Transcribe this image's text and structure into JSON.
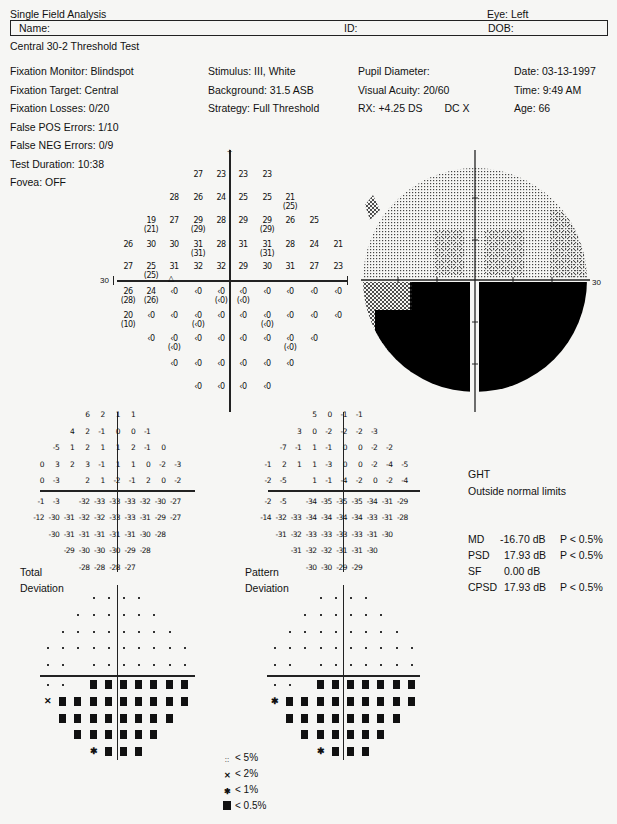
{
  "header": {
    "title": "Single Field Analysis",
    "eye": "Eye: Left",
    "name_label": "Name:",
    "id_label": "ID:",
    "dob_label": "DOB:",
    "test_name": "Central 30-2 Threshold Test"
  },
  "info": {
    "col1": [
      "Fixation Monitor: Blindspot",
      "Fixation Target: Central",
      "Fixation Losses: 0/20",
      "False POS Errors: 1/10",
      "False NEG Errors: 0/9",
      "Test Duration: 10:38"
    ],
    "col2": [
      "Stimulus: III, White",
      "Background: 31.5 ASB",
      "Strategy: Full Threshold"
    ],
    "col3": [
      "Pupil Diameter:",
      "Visual Acuity: 20/60",
      "RX: +4.25 DS",
      "DC  X"
    ],
    "col4": [
      "Date: 03-13-1997",
      "Time:  9:49 AM",
      "Age: 66"
    ],
    "fovea": "Fovea: OFF"
  },
  "threshold_axis_label": "30",
  "grayscale_axis_label": "30",
  "labels": {
    "total": "Total",
    "deviation": "Deviation",
    "pattern": "Pattern",
    "deviation2": "Deviation"
  },
  "ght": {
    "title": "GHT",
    "result": "Outside normal limits"
  },
  "indices": [
    {
      "name": "MD",
      "value": "-16.70 dB",
      "p": "P < 0.5%"
    },
    {
      "name": "PSD",
      "value": "17.93 dB",
      "p": "P < 0.5%"
    },
    {
      "name": "SF",
      "value": "0.00 dB",
      "p": ""
    },
    {
      "name": "CPSD",
      "value": "17.93 dB",
      "p": "P < 0.5%"
    }
  ],
  "legend": [
    {
      "symbol": "dots",
      "label": "< 5%"
    },
    {
      "symbol": "light-hatch",
      "label": "< 2%"
    },
    {
      "symbol": "dark-hatch",
      "label": "< 1%"
    },
    {
      "symbol": "solid",
      "label": "< 0.5%"
    }
  ],
  "chart_data": [
    {
      "type": "table",
      "title": "Threshold values (dB), Central 30-2, Left eye",
      "grid_columns_x_deg": [
        -27,
        -21,
        -15,
        -9,
        -3,
        3,
        9,
        15,
        21,
        27
      ],
      "rows": [
        {
          "y": 27,
          "cells": [
            null,
            null,
            null,
            "27",
            "23",
            "23",
            "23",
            null,
            null,
            null
          ]
        },
        {
          "y": 21,
          "cells": [
            null,
            null,
            "28",
            "26",
            "24",
            "25",
            "25",
            "21 (25)",
            null,
            null
          ]
        },
        {
          "y": 15,
          "cells": [
            null,
            "19 (21)",
            "27",
            "29 (29)",
            "28",
            "29",
            "29 (29)",
            "26",
            "25",
            null
          ]
        },
        {
          "y": 9,
          "cells": [
            "26",
            "30",
            "30",
            "31 (31)",
            "28",
            "31",
            "31 (31)",
            "28",
            "24",
            "21"
          ]
        },
        {
          "y": 3,
          "cells": [
            "27",
            "25 (25)",
            "31",
            "32",
            "32",
            "29",
            "30",
            "31",
            "27",
            "23"
          ]
        },
        {
          "y": -3,
          "cells": [
            "26 (28)",
            "24 (26)",
            "<0",
            "<0",
            "<0 (<0)",
            "<0 (<0)",
            "<0",
            "<0",
            "<0",
            "<0"
          ]
        },
        {
          "y": -9,
          "cells": [
            "20 (10)",
            "<0",
            "<0",
            "<0 (<0)",
            "<0",
            "<0",
            "<0 (<0)",
            "<0",
            "<0",
            "<0"
          ]
        },
        {
          "y": -15,
          "cells": [
            null,
            "<0",
            "<0 (<0)",
            "<0",
            "<0",
            "<0",
            "<0",
            "<0 (<0)",
            "<0",
            null
          ]
        },
        {
          "y": -21,
          "cells": [
            null,
            null,
            "<0",
            "<0",
            "<0",
            "<0",
            "<0",
            "<0",
            null,
            null
          ]
        },
        {
          "y": -27,
          "cells": [
            null,
            null,
            null,
            "<0",
            "<0",
            "<0",
            "<0",
            null,
            null,
            null
          ]
        }
      ],
      "blind_spot_marker": "triangle at (-15, -3)",
      "axis_extent_label": "30"
    },
    {
      "type": "heatmap",
      "title": "Grayscale",
      "description": "Upper hemifield light stipple; lower hemifield solid black except inferonasal-left edge patchy",
      "axis_extent_label": "30"
    },
    {
      "type": "table",
      "title": "Total Deviation (dB)",
      "rows": [
        [
          "",
          "",
          "",
          "6",
          "2",
          "1",
          "1",
          "",
          "",
          ""
        ],
        [
          "",
          "",
          "4",
          "2",
          "-1",
          "0",
          "0",
          "-1",
          "",
          ""
        ],
        [
          "",
          "-5",
          "1",
          "2",
          "1",
          "1",
          "2",
          "-1",
          "0",
          ""
        ],
        [
          "0",
          "3",
          "2",
          "3",
          "-1",
          "1",
          "1",
          "0",
          "-2",
          "-3"
        ],
        [
          "0",
          "-3",
          "",
          "2",
          "1",
          "-2",
          "-1",
          "2",
          "0",
          "-2"
        ],
        [
          "-1",
          "-3",
          "",
          "-32",
          "-33",
          "-33",
          "-33",
          "-32",
          "-30",
          "-27"
        ],
        [
          "-12",
          "-30",
          "-31",
          "-32",
          "-32",
          "-33",
          "-33",
          "-31",
          "-29",
          "-27"
        ],
        [
          "",
          "-30",
          "-31",
          "-31",
          "-31",
          "-31",
          "-31",
          "-30",
          "-28",
          ""
        ],
        [
          "",
          "",
          "-29",
          "-30",
          "-30",
          "-30",
          "-29",
          "-28",
          "",
          ""
        ],
        [
          "",
          "",
          "",
          "-28",
          "-28",
          "-28",
          "-27",
          "",
          "",
          ""
        ]
      ]
    },
    {
      "type": "table",
      "title": "Pattern Deviation (dB)",
      "rows": [
        [
          "",
          "",
          "",
          "5",
          "0",
          "-1",
          "-1",
          "",
          "",
          ""
        ],
        [
          "",
          "",
          "3",
          "0",
          "-2",
          "-2",
          "-2",
          "-3",
          "",
          ""
        ],
        [
          "",
          "-7",
          "-1",
          "1",
          "-1",
          "0",
          "0",
          "-2",
          "-2",
          ""
        ],
        [
          "-1",
          "2",
          "1",
          "1",
          "-3",
          "0",
          "0",
          "-2",
          "-4",
          "-5"
        ],
        [
          "-2",
          "-5",
          "",
          "1",
          "-1",
          "-4",
          "-2",
          "0",
          "-2",
          "-4"
        ],
        [
          "-2",
          "-5",
          "",
          "-34",
          "-35",
          "-35",
          "-35",
          "-34",
          "-31",
          "-29"
        ],
        [
          "-14",
          "-32",
          "-33",
          "-34",
          "-34",
          "-34",
          "-34",
          "-33",
          "-31",
          "-28"
        ],
        [
          "",
          "-31",
          "-32",
          "-33",
          "-33",
          "-33",
          "-33",
          "-31",
          "-30",
          ""
        ],
        [
          "",
          "",
          "-31",
          "-32",
          "-32",
          "-31",
          "-31",
          "-30",
          "",
          ""
        ],
        [
          "",
          "",
          "",
          "-30",
          "-30",
          "-29",
          "-29",
          "",
          "",
          ""
        ]
      ]
    },
    {
      "type": "heatmap",
      "title": "Total Deviation probability plot",
      "rows": [
        [
          "",
          "",
          "",
          "n",
          "n",
          "n",
          "n",
          "",
          "",
          ""
        ],
        [
          "",
          "",
          "n",
          "n",
          "n",
          "n",
          "n",
          "n",
          "",
          ""
        ],
        [
          "",
          "n",
          "n",
          "n",
          "n",
          "n",
          "n",
          "n",
          "n",
          ""
        ],
        [
          "n",
          "n",
          "n",
          "n",
          "n",
          "n",
          "n",
          "n",
          "n",
          "n"
        ],
        [
          "n",
          "n",
          "",
          "n",
          "n",
          "n",
          "n",
          "n",
          "n",
          "n"
        ],
        [
          "n",
          "n",
          "",
          "s",
          "s",
          "s",
          "s",
          "s",
          "s",
          "s"
        ],
        [
          "p2",
          "s",
          "s",
          "s",
          "s",
          "s",
          "s",
          "s",
          "s",
          "s"
        ],
        [
          "",
          "s",
          "s",
          "s",
          "s",
          "s",
          "s",
          "s",
          "s",
          ""
        ],
        [
          "",
          "",
          "s",
          "s",
          "s",
          "s",
          "s",
          "s",
          "",
          ""
        ],
        [
          "",
          "",
          "",
          "p1",
          "s",
          "s",
          "s",
          "",
          "",
          ""
        ]
      ],
      "key": {
        "n": "normal",
        "p2": "< 2%",
        "p1": "< 1%",
        "s": "< 0.5%"
      }
    },
    {
      "type": "heatmap",
      "title": "Pattern Deviation probability plot",
      "rows": [
        [
          "",
          "",
          "",
          "n",
          "n",
          "n",
          "n",
          "",
          "",
          ""
        ],
        [
          "",
          "",
          "n",
          "n",
          "n",
          "n",
          "n",
          "n",
          "",
          ""
        ],
        [
          "",
          "n",
          "n",
          "n",
          "n",
          "n",
          "n",
          "n",
          "n",
          ""
        ],
        [
          "n",
          "n",
          "n",
          "n",
          "n",
          "n",
          "n",
          "n",
          "n",
          "n"
        ],
        [
          "n",
          "n",
          "",
          "n",
          "n",
          "n",
          "n",
          "n",
          "n",
          "n"
        ],
        [
          "n",
          "n",
          "",
          "s",
          "s",
          "s",
          "s",
          "s",
          "s",
          "s"
        ],
        [
          "p1",
          "s",
          "s",
          "s",
          "s",
          "s",
          "s",
          "s",
          "s",
          "s"
        ],
        [
          "",
          "s",
          "s",
          "s",
          "s",
          "s",
          "s",
          "s",
          "s",
          ""
        ],
        [
          "",
          "",
          "s",
          "s",
          "s",
          "s",
          "s",
          "s",
          "",
          ""
        ],
        [
          "",
          "",
          "",
          "p1",
          "s",
          "s",
          "s",
          "",
          "",
          ""
        ]
      ],
      "key": {
        "n": "normal",
        "p1": "< 1%",
        "s": "< 0.5%"
      }
    }
  ]
}
